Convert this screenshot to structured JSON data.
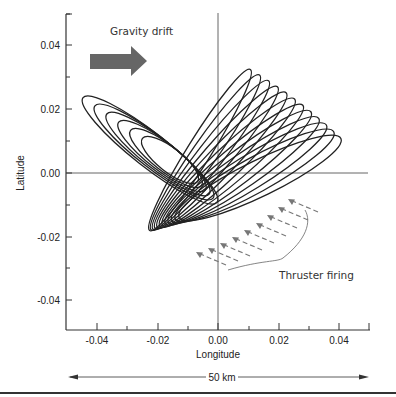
{
  "chart_data": {
    "type": "line",
    "title": "",
    "xlabel": "Longitude",
    "ylabel": "Latitude",
    "xlim": [
      -0.05,
      0.05
    ],
    "ylim": [
      -0.05,
      0.05
    ],
    "x_ticks": [
      "-0.04",
      "-0.02",
      "0.00",
      "0.02",
      "0.04"
    ],
    "y_ticks": [
      "0.04",
      "0.02",
      "0.00",
      "-0.02",
      "-0.04"
    ],
    "grid": false,
    "zero_lines": true,
    "series": [
      {
        "name": "Drift ellipses (tilted left)",
        "description": "Nested elongated elliptical orbit tracks centered near (-0.012, 0.0) tilted from upper-left to lower-right",
        "count": 6
      },
      {
        "name": "Drift ellipses (tilted right)",
        "description": "Family of elongated ellipses fanning from lower-left (-0.015,-0.025) up to (0.035, 0.0) and top near (0.0, 0.022)",
        "count": 12
      }
    ],
    "annotations": [
      {
        "text": "Gravity drift",
        "type": "arrow",
        "direction": "right",
        "x": -0.03,
        "y": 0.035
      },
      {
        "text": "Thruster firing",
        "type": "dashed-arrows-brace",
        "count": 9
      },
      {
        "text": "50 km",
        "type": "scale-bar",
        "span": "full x-axis"
      }
    ]
  },
  "labels": {
    "gravity_drift": "Gravity drift",
    "thruster_firing": "Thruster firing",
    "scale": "50 km",
    "xlabel": "Longitude",
    "ylabel": "Latitude"
  },
  "ticks": {
    "x": [
      "-0.04",
      "-0.02",
      "0.00",
      "0.02",
      "0.04"
    ],
    "y": [
      "0.04",
      "0.02",
      "0.00",
      "-0.02",
      "-0.04"
    ]
  },
  "colors": {
    "ink": "#222222",
    "arrow_fill": "#666666",
    "thruster": "#777777"
  }
}
